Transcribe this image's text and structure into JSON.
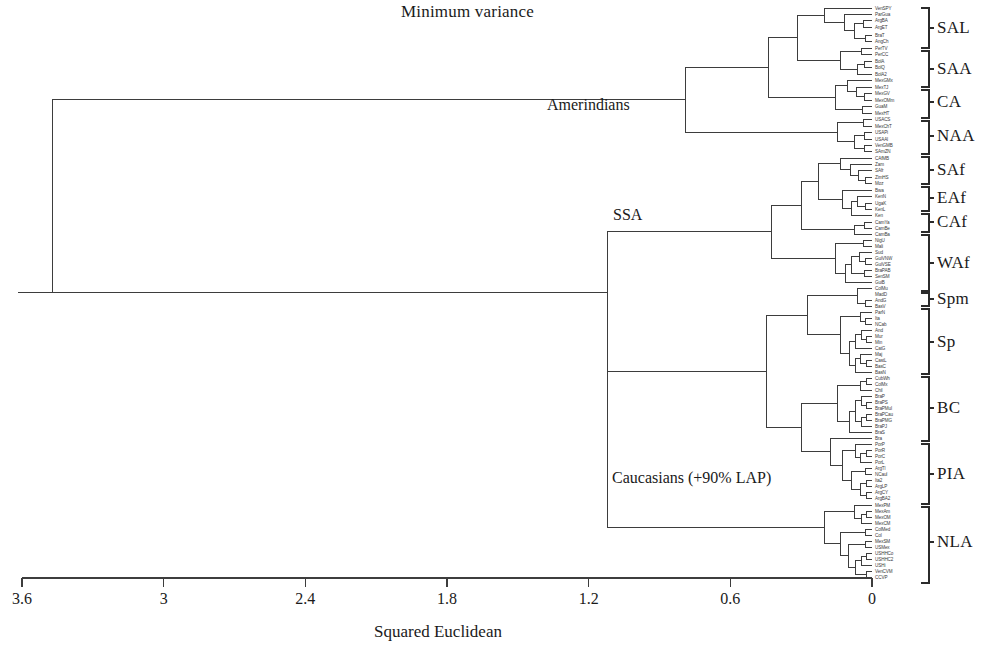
{
  "chart_data": {
    "type": "dendrogram",
    "title": "Minimum variance",
    "xlabel": "Squared Euclidean",
    "ylabel": "",
    "grid": false,
    "legend": "none",
    "axis": {
      "orientation": "horizontal-reversed",
      "xlim": [
        3.6,
        0
      ],
      "tick_values": [
        3.6,
        3,
        2.4,
        1.8,
        1.2,
        0.6,
        0
      ],
      "tick_labels": [
        "3.6",
        "3",
        "2.4",
        "1.8",
        "1.2",
        "0.6",
        "0"
      ],
      "pixel_x_at_3_6": 22,
      "pixel_x_at_0": 872
    },
    "internal_node_labels": [
      {
        "text": "Amerindians",
        "merge_distance": 0.79,
        "x_px": 697,
        "y_px": 128
      },
      {
        "text": "SSA",
        "merge_distance": 1.12,
        "x_px": 607,
        "y_px": 235
      },
      {
        "text": "Caucasians (+90% LAP)",
        "merge_distance": 1.12,
        "x_px": 607,
        "y_px": 497
      }
    ],
    "root": {
      "merge_distance": 3.47,
      "x_px": 57
    },
    "cluster_brackets": [
      {
        "label": "SAL",
        "y_center": 28,
        "y_top": 8,
        "y_bottom": 48,
        "n_leaves": 7
      },
      {
        "label": "SAA",
        "y_center": 69,
        "y_top": 51,
        "y_bottom": 87,
        "n_leaves": 6
      },
      {
        "label": "CA",
        "y_center": 102,
        "y_top": 90,
        "y_bottom": 118,
        "n_leaves": 5
      },
      {
        "label": "NAA",
        "y_center": 136,
        "y_top": 121,
        "y_bottom": 154,
        "n_leaves": 6
      },
      {
        "label": "SAf",
        "y_center": 170,
        "y_top": 157,
        "y_bottom": 184,
        "n_leaves": 5
      },
      {
        "label": "EAf",
        "y_center": 198,
        "y_top": 187,
        "y_bottom": 211,
        "n_leaves": 4
      },
      {
        "label": "CAf",
        "y_center": 222,
        "y_top": 214,
        "y_bottom": 232,
        "n_leaves": 3
      },
      {
        "label": "WAf",
        "y_center": 263,
        "y_top": 235,
        "y_bottom": 291,
        "n_leaves": 10
      },
      {
        "label": "Spm",
        "y_center": 299,
        "y_top": 293,
        "y_bottom": 306,
        "n_leaves": 3
      },
      {
        "label": "Sp",
        "y_center": 342,
        "y_top": 309,
        "y_bottom": 374,
        "n_leaves": 11
      },
      {
        "label": "BC",
        "y_center": 408,
        "y_top": 377,
        "y_bottom": 441,
        "n_leaves": 11
      },
      {
        "label": "PIA",
        "y_center": 474,
        "y_top": 444,
        "y_bottom": 504,
        "n_leaves": 10
      },
      {
        "label": "NLA",
        "y_center": 542,
        "y_top": 507,
        "y_bottom": 583,
        "n_leaves": 13
      }
    ],
    "leaves": [
      {
        "name": "VenSPY",
        "y": 8,
        "merge_x": 0.0
      },
      {
        "name": "ParGua",
        "y": 14,
        "merge_x": 0.0
      },
      {
        "name": "ArgBA",
        "y": 20,
        "merge_x": 0.0
      },
      {
        "name": "ArgET",
        "y": 27,
        "merge_x": 0.0
      },
      {
        "name": "BraT",
        "y": 35,
        "merge_x": 0.0
      },
      {
        "name": "AngCh",
        "y": 41,
        "merge_x": 0.0
      },
      {
        "name": "PerTV",
        "y": 48,
        "merge_x": 0.0
      },
      {
        "name": "PerCC",
        "y": 54,
        "merge_x": 0.0
      },
      {
        "name": "BolA",
        "y": 61,
        "merge_x": 0.0
      },
      {
        "name": "BolQ",
        "y": 67,
        "merge_x": 0.0
      },
      {
        "name": "BolA2",
        "y": 74,
        "merge_x": 0.0
      },
      {
        "name": "MexGMx",
        "y": 80,
        "merge_x": 0.0
      },
      {
        "name": "MexTJ",
        "y": 87,
        "merge_x": 0.0
      },
      {
        "name": "MexGV",
        "y": 93,
        "merge_x": 0.0
      },
      {
        "name": "MexOMm",
        "y": 100,
        "merge_x": 0.0
      },
      {
        "name": "GuaM",
        "y": 106,
        "merge_x": 0.0
      },
      {
        "name": "MexHT",
        "y": 113,
        "merge_x": 0.0
      },
      {
        "name": "USACS",
        "y": 119,
        "merge_x": 0.0
      },
      {
        "name": "MexChT",
        "y": 126,
        "merge_x": 0.0
      },
      {
        "name": "USAPi",
        "y": 132,
        "merge_x": 0.0
      },
      {
        "name": "USAAl",
        "y": 139,
        "merge_x": 0.0
      },
      {
        "name": "VenGMB",
        "y": 145,
        "merge_x": 0.0
      },
      {
        "name": "SAmZN",
        "y": 151,
        "merge_x": 0.0
      },
      {
        "name": "CAfMB",
        "y": 158,
        "merge_x": 0.0
      },
      {
        "name": "Zam",
        "y": 164,
        "merge_x": 0.0
      },
      {
        "name": "SAfr",
        "y": 170,
        "merge_x": 0.0
      },
      {
        "name": "ZimHS",
        "y": 177,
        "merge_x": 0.0
      },
      {
        "name": "Moz",
        "y": 183,
        "merge_x": 0.0
      },
      {
        "name": "Bwa",
        "y": 190,
        "merge_x": 0.0
      },
      {
        "name": "KenN",
        "y": 196,
        "merge_x": 0.0
      },
      {
        "name": "UgaK",
        "y": 203,
        "merge_x": 0.0
      },
      {
        "name": "KenL",
        "y": 209,
        "merge_x": 0.0
      },
      {
        "name": "Ken",
        "y": 215,
        "merge_x": 0.0
      },
      {
        "name": "CamYa",
        "y": 222,
        "merge_x": 0.0
      },
      {
        "name": "CamBe",
        "y": 228,
        "merge_x": 0.0
      },
      {
        "name": "CamBa",
        "y": 234,
        "merge_x": 0.0
      },
      {
        "name": "NigU",
        "y": 240,
        "merge_x": 0.0
      },
      {
        "name": "Mali",
        "y": 246,
        "merge_x": 0.0
      },
      {
        "name": "Sud",
        "y": 252,
        "merge_x": 0.0
      },
      {
        "name": "GuiVNW",
        "y": 258,
        "merge_x": 0.0
      },
      {
        "name": "GuiVSE",
        "y": 264,
        "merge_x": 0.0
      },
      {
        "name": "BraPAB",
        "y": 270,
        "merge_x": 0.0
      },
      {
        "name": "SenSM",
        "y": 276,
        "merge_x": 0.0
      },
      {
        "name": "GuiB",
        "y": 282,
        "merge_x": 0.0
      },
      {
        "name": "ColMu",
        "y": 288,
        "merge_x": 0.0
      },
      {
        "name": "MadD",
        "y": 294,
        "merge_x": 0.0
      },
      {
        "name": "AndG",
        "y": 300,
        "merge_x": 0.0
      },
      {
        "name": "BasV",
        "y": 306,
        "merge_x": 0.0
      },
      {
        "name": "ParN",
        "y": 312,
        "merge_x": 0.0
      },
      {
        "name": "Ita",
        "y": 318,
        "merge_x": 0.0
      },
      {
        "name": "NCab",
        "y": 324,
        "merge_x": 0.0
      },
      {
        "name": "And",
        "y": 330,
        "merge_x": 0.0
      },
      {
        "name": "Mur",
        "y": 336,
        "merge_x": 0.0
      },
      {
        "name": "Min",
        "y": 342,
        "merge_x": 0.0
      },
      {
        "name": "CatG",
        "y": 348,
        "merge_x": 0.0
      },
      {
        "name": "Maj",
        "y": 354,
        "merge_x": 0.0
      },
      {
        "name": "CastL",
        "y": 360,
        "merge_x": 0.0
      },
      {
        "name": "BasC",
        "y": 366,
        "merge_x": 0.0
      },
      {
        "name": "BasN",
        "y": 372,
        "merge_x": 0.0
      },
      {
        "name": "CubWh",
        "y": 378,
        "merge_x": 0.0
      },
      {
        "name": "ColMx",
        "y": 384,
        "merge_x": 0.0
      },
      {
        "name": "Chil",
        "y": 390,
        "merge_x": 0.0
      },
      {
        "name": "BraP",
        "y": 396,
        "merge_x": 0.0
      },
      {
        "name": "BraPS",
        "y": 402,
        "merge_x": 0.0
      },
      {
        "name": "BraPMul",
        "y": 408,
        "merge_x": 0.0
      },
      {
        "name": "BraPCau",
        "y": 414,
        "merge_x": 0.0
      },
      {
        "name": "BraPMG",
        "y": 420,
        "merge_x": 0.0
      },
      {
        "name": "BraPJ",
        "y": 426,
        "merge_x": 0.0
      },
      {
        "name": "BraS",
        "y": 432,
        "merge_x": 0.0
      },
      {
        "name": "Bra",
        "y": 438,
        "merge_x": 0.0
      },
      {
        "name": "PorP",
        "y": 444,
        "merge_x": 0.0
      },
      {
        "name": "PorR",
        "y": 450,
        "merge_x": 0.0
      },
      {
        "name": "PorC",
        "y": 456,
        "merge_x": 0.0
      },
      {
        "name": "PorL",
        "y": 462,
        "merge_x": 0.0
      },
      {
        "name": "ArgTl",
        "y": 468,
        "merge_x": 0.0
      },
      {
        "name": "NCaul",
        "y": 474,
        "merge_x": 0.0
      },
      {
        "name": "Ita2",
        "y": 480,
        "merge_x": 0.0
      },
      {
        "name": "ArgLP",
        "y": 486,
        "merge_x": 0.0
      },
      {
        "name": "ArgCY",
        "y": 492,
        "merge_x": 0.0
      },
      {
        "name": "ArgBA2",
        "y": 498,
        "merge_x": 0.0
      },
      {
        "name": "MexPM",
        "y": 505,
        "merge_x": 0.0
      },
      {
        "name": "MexAm",
        "y": 511,
        "merge_x": 0.0
      },
      {
        "name": "MexOM",
        "y": 517,
        "merge_x": 0.0
      },
      {
        "name": "MexCM",
        "y": 523,
        "merge_x": 0.0
      },
      {
        "name": "ColMed",
        "y": 529,
        "merge_x": 0.0
      },
      {
        "name": "Col",
        "y": 535,
        "merge_x": 0.0
      },
      {
        "name": "MexSM",
        "y": 541,
        "merge_x": 0.0
      },
      {
        "name": "USMex",
        "y": 547,
        "merge_x": 0.0
      },
      {
        "name": "USHHCo",
        "y": 553,
        "merge_x": 0.0
      },
      {
        "name": "USHHC2",
        "y": 559,
        "merge_x": 0.0
      },
      {
        "name": "USHi",
        "y": 565,
        "merge_x": 0.0
      },
      {
        "name": "VenCVM",
        "y": 571,
        "merge_x": 0.0
      },
      {
        "name": "CCVP",
        "y": 577,
        "merge_x": 0.0
      }
    ]
  },
  "title": {
    "text": "Minimum variance"
  },
  "axis": {
    "caption": "Squared Euclidean",
    "ticks": [
      "3.6",
      "3",
      "2.4",
      "1.8",
      "1.2",
      "0.6",
      "0"
    ]
  },
  "node_labels": {
    "amerindians": "Amerindians",
    "ssa": "SSA",
    "caucasians": "Caucasians (+90% LAP)"
  },
  "clusters": [
    "SAL",
    "SAA",
    "CA",
    "NAA",
    "SAf",
    "EAf",
    "CAf",
    "WAf",
    "Spm",
    "Sp",
    "BC",
    "PIA",
    "NLA"
  ],
  "colors": {
    "line": "#3d3d3d",
    "text": "#1a1a1a",
    "leaf_text": "#3a3a3a",
    "background": "#ffffff"
  }
}
